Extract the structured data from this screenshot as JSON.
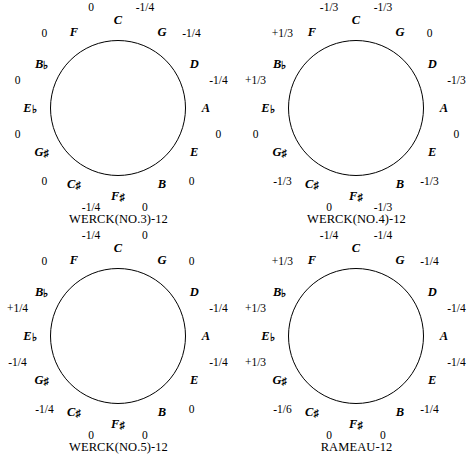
{
  "figure": {
    "type": "temperament-circle-of-fifths-grid",
    "rows": 2,
    "cols": 2,
    "note_order": [
      "C",
      "G",
      "D",
      "A",
      "E",
      "B",
      "F#",
      "C#",
      "G#",
      "Eb",
      "Bb",
      "F"
    ],
    "accidental_glyphs": {
      "sharp": "♯",
      "flat": "♭"
    }
  },
  "charts": [
    {
      "id": "werck-no3",
      "caption": "WERCK(NO.3)-12",
      "notes": [
        {
          "label": "C",
          "accidental": ""
        },
        {
          "label": "G",
          "accidental": ""
        },
        {
          "label": "D",
          "accidental": ""
        },
        {
          "label": "A",
          "accidental": ""
        },
        {
          "label": "E",
          "accidental": ""
        },
        {
          "label": "B",
          "accidental": ""
        },
        {
          "label": "F",
          "accidental": "♯"
        },
        {
          "label": "C",
          "accidental": "♯"
        },
        {
          "label": "G",
          "accidental": "♯"
        },
        {
          "label": "E",
          "accidental": "♭"
        },
        {
          "label": "B",
          "accidental": "♭"
        },
        {
          "label": "F",
          "accidental": ""
        }
      ],
      "values": [
        "-1/4",
        "-1/4",
        "-1/4",
        "0",
        "0",
        "0",
        "-1/4",
        "0",
        "0",
        "0",
        "0",
        "0"
      ]
    },
    {
      "id": "werck-no4",
      "caption": "WERCK(NO.4)-12",
      "notes": [
        {
          "label": "C",
          "accidental": ""
        },
        {
          "label": "G",
          "accidental": ""
        },
        {
          "label": "D",
          "accidental": ""
        },
        {
          "label": "A",
          "accidental": ""
        },
        {
          "label": "E",
          "accidental": ""
        },
        {
          "label": "B",
          "accidental": ""
        },
        {
          "label": "F",
          "accidental": "♯"
        },
        {
          "label": "C",
          "accidental": "♯"
        },
        {
          "label": "G",
          "accidental": "♯"
        },
        {
          "label": "E",
          "accidental": "♭"
        },
        {
          "label": "B",
          "accidental": "♭"
        },
        {
          "label": "F",
          "accidental": ""
        }
      ],
      "values": [
        "-1/3",
        "0",
        "-1/3",
        "0",
        "-1/3",
        "-1/3",
        "0",
        "-1/3",
        "0",
        "+1/3",
        "+1/3",
        "-1/3"
      ]
    },
    {
      "id": "werck-no5",
      "caption": "WERCK(NO.5)-12",
      "notes": [
        {
          "label": "C",
          "accidental": ""
        },
        {
          "label": "G",
          "accidental": ""
        },
        {
          "label": "D",
          "accidental": ""
        },
        {
          "label": "A",
          "accidental": ""
        },
        {
          "label": "E",
          "accidental": ""
        },
        {
          "label": "B",
          "accidental": ""
        },
        {
          "label": "F",
          "accidental": "♯"
        },
        {
          "label": "C",
          "accidental": "♯"
        },
        {
          "label": "G",
          "accidental": "♯"
        },
        {
          "label": "E",
          "accidental": "♭"
        },
        {
          "label": "B",
          "accidental": "♭"
        },
        {
          "label": "F",
          "accidental": ""
        }
      ],
      "values": [
        "0",
        "0",
        "-1/4",
        "-1/4",
        "0",
        "0",
        "0",
        "-1/4",
        "-1/4",
        "+1/4",
        "0",
        "-1/4"
      ]
    },
    {
      "id": "rameau",
      "caption": "RAMEAU-12",
      "notes": [
        {
          "label": "C",
          "accidental": ""
        },
        {
          "label": "G",
          "accidental": ""
        },
        {
          "label": "D",
          "accidental": ""
        },
        {
          "label": "A",
          "accidental": ""
        },
        {
          "label": "E",
          "accidental": ""
        },
        {
          "label": "B",
          "accidental": ""
        },
        {
          "label": "F",
          "accidental": "♯"
        },
        {
          "label": "C",
          "accidental": "♯"
        },
        {
          "label": "G",
          "accidental": "♯"
        },
        {
          "label": "E",
          "accidental": "♭"
        },
        {
          "label": "B",
          "accidental": "♭"
        },
        {
          "label": "F",
          "accidental": ""
        }
      ],
      "values": [
        "-1/4",
        "-1/4",
        "-1/4",
        "-1/4",
        "-1/4",
        "0",
        "0",
        "-1/6",
        "+1/3",
        "+1/3",
        "+1/3",
        "-1/4"
      ]
    }
  ]
}
